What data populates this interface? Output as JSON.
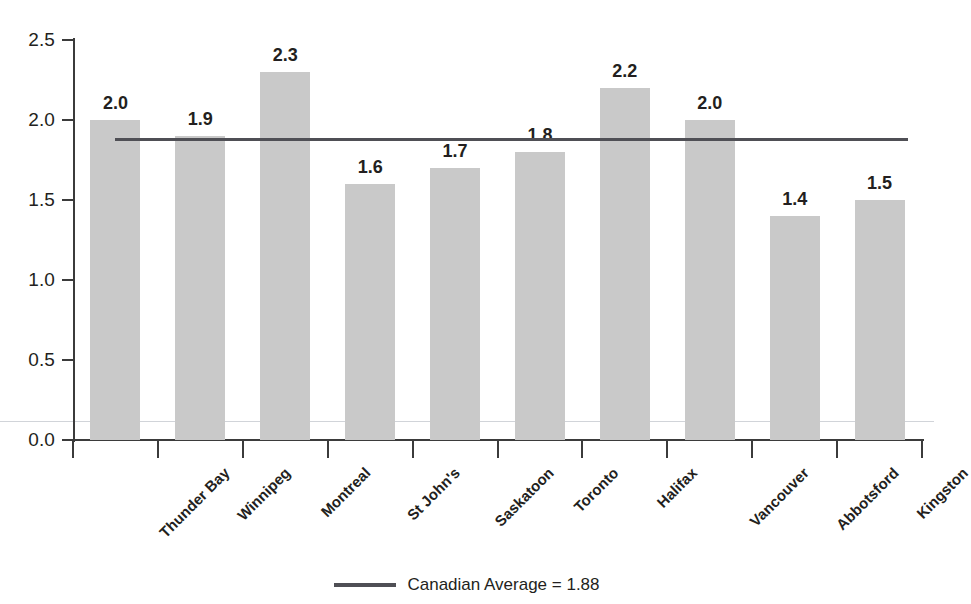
{
  "chart_data": {
    "type": "bar",
    "title": "",
    "xlabel": "",
    "ylabel": "",
    "ylim": [
      0.0,
      2.5
    ],
    "ytick_labels": [
      "2.5",
      "2.0",
      "1.5",
      "1.0",
      "0.5",
      "0.0"
    ],
    "ytick_values": [
      2.5,
      2.0,
      1.5,
      1.0,
      0.5,
      0.0
    ],
    "grid": false,
    "categories": [
      "Thunder Bay",
      "Winnipeg",
      "Montreal",
      "St John's",
      "Saskatoon",
      "Toronto",
      "Halifax",
      "Vancouver",
      "Abbotsford",
      "Kingston"
    ],
    "values": [
      2.0,
      1.9,
      2.3,
      1.6,
      1.7,
      1.8,
      2.2,
      2.0,
      1.4,
      1.5
    ],
    "value_labels": [
      "2.0",
      "1.9",
      "2.3",
      "1.6",
      "1.7",
      "1.8",
      "2.2",
      "2.0",
      "1.4",
      "1.5"
    ],
    "bar_color": "#c9c9c9",
    "reference_line": {
      "label": "Canadian Average = 1.88",
      "value": 1.88,
      "color": "#4f4f55"
    },
    "legend": {
      "position": "bottom-center",
      "entries": [
        {
          "label": "Canadian Average = 1.88",
          "type": "line",
          "color": "#4f4f55"
        }
      ]
    }
  }
}
